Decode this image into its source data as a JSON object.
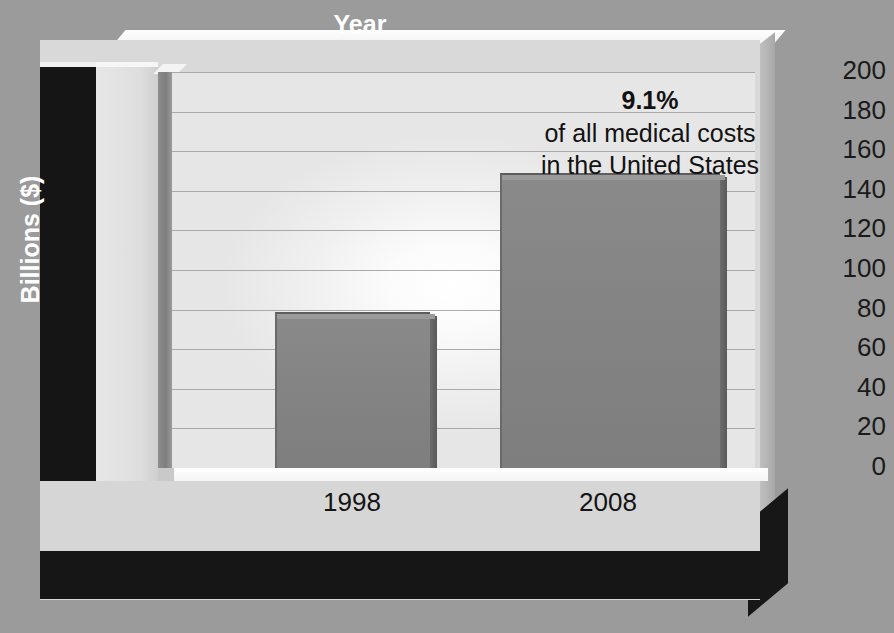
{
  "chart_data": {
    "type": "bar",
    "title": "",
    "subtitle": "",
    "xlabel": "Year",
    "ylabel": "Billions ($)",
    "categories": [
      "1998",
      "2008"
    ],
    "values": [
      79,
      149
    ],
    "series": [
      {
        "name": "Medical costs",
        "values": [
          79,
          149
        ]
      }
    ],
    "ylim": [
      0,
      200
    ],
    "ytick_labels": [
      "200",
      "180",
      "160",
      "140",
      "120",
      "100",
      "80",
      "60",
      "40",
      "20",
      "0"
    ],
    "ytick_values": [
      200,
      180,
      160,
      140,
      120,
      100,
      80,
      60,
      40,
      20,
      0
    ],
    "ystep": 20,
    "grid": true,
    "legend": "none",
    "annotations": [
      {
        "percent": "9.1%",
        "line1": "of all medical costs",
        "line2": "in the United States"
      }
    ],
    "style": {
      "bar_color": "#848484",
      "bar_edge_color": "#5d5d5d",
      "plot_background": "#f2f2f2",
      "canvas_background": "#9b9b9b",
      "axis_band_color": "#151515",
      "axis_text_color": "#ffffff",
      "tick_text_color": "#1a1a1a",
      "gridline_color": "#9d9d9d"
    }
  },
  "axes": {
    "y_title": "Billions ($)",
    "x_title": "Year"
  },
  "annotation": {
    "percent": "9.1%",
    "line1": "of all medical costs",
    "line2": "in the United States"
  }
}
